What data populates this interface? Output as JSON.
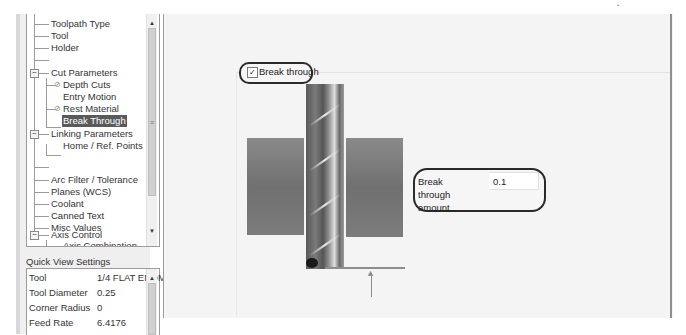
{
  "tree": {
    "items": [
      {
        "label": "Toolpath Type",
        "level": 1
      },
      {
        "label": "Tool",
        "level": 1
      },
      {
        "label": "Holder",
        "level": 1
      },
      {
        "label": "",
        "level": 1
      },
      {
        "label": "Cut Parameters",
        "level": 1,
        "expander": "−"
      },
      {
        "label": "Depth Cuts",
        "level": 2,
        "icon": "disabled-icon"
      },
      {
        "label": "Entry Motion",
        "level": 2
      },
      {
        "label": "Rest Material",
        "level": 2,
        "icon": "disabled-icon"
      },
      {
        "label": "Break Through",
        "level": 2,
        "selected": true
      },
      {
        "label": "Linking Parameters",
        "level": 1,
        "expander": "−"
      },
      {
        "label": "Home / Ref. Points",
        "level": 2
      },
      {
        "label": "",
        "level": 1
      },
      {
        "label": "Arc Filter / Tolerance",
        "level": 1
      },
      {
        "label": "Planes (WCS)",
        "level": 1
      },
      {
        "label": "Coolant",
        "level": 1
      },
      {
        "label": "Canned Text",
        "level": 1
      },
      {
        "label": "Misc Values",
        "level": 1
      },
      {
        "label": "Axis Control",
        "level": 1,
        "expander": "−"
      },
      {
        "label": "Axis Combination",
        "level": 2
      }
    ],
    "expander_glyph": "−",
    "disabled_glyph": "⊘",
    "scroll_up": "▲",
    "scroll_down": "▼",
    "scroll_grip": "≡"
  },
  "quick_view": {
    "title": "Quick View Settings",
    "rows": [
      {
        "label": "Tool",
        "value": "1/4 FLAT ENDM"
      },
      {
        "label": "Tool Diameter",
        "value": "0.25"
      },
      {
        "label": "Corner Radius",
        "value": "0"
      },
      {
        "label": "Feed Rate",
        "value": "6.4176"
      }
    ],
    "scroll_up": "▲"
  },
  "main": {
    "break_through_checkbox": {
      "label": "Break through",
      "checked": true,
      "check_glyph": "✓"
    },
    "break_through_amount": {
      "label": "Break through amount",
      "value": "0.1"
    },
    "arrow_glyph": "▲"
  }
}
